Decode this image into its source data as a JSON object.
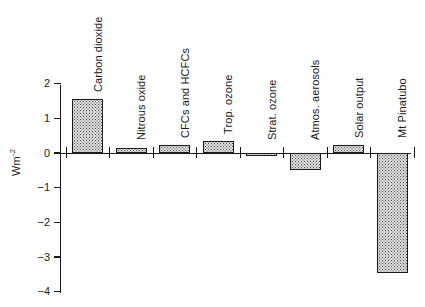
{
  "chart_data": {
    "type": "bar",
    "title": "",
    "subtitle": "",
    "xlabel": "",
    "ylabel": "Wm",
    "ylabel_exponent": "-2",
    "ylabel_full": "Wm-2",
    "categories": [
      "Carbon dioxide",
      "Nitrous oxide",
      "CFCs and HCFCs",
      "Trop. ozone",
      "Strat. ozone",
      "Atmos. aerosols",
      "Solar output",
      "Mt Pinatubo"
    ],
    "values": [
      1.56,
      0.14,
      0.23,
      0.35,
      -0.1,
      -0.49,
      0.23,
      -3.46
    ],
    "ylim": [
      -4,
      2
    ],
    "yticks": [
      2,
      1,
      0,
      -1,
      -2,
      -3,
      -4
    ],
    "ytick_labels": [
      "2",
      "1",
      "0",
      "−1",
      "−2",
      "−3",
      "−4"
    ],
    "grid": false,
    "legend": false,
    "legend_position": "none",
    "bar_fill": "#e2e2e2",
    "bar_edge": "#1a1a1a",
    "axis_color": "#1a1a1a",
    "background": "#ffffff"
  }
}
